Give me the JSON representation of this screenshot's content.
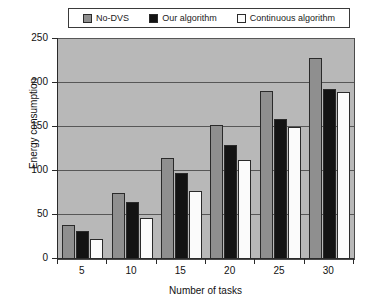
{
  "chart_data": {
    "type": "bar",
    "title": "",
    "xlabel": "Number of tasks",
    "ylabel": "Energy consumption",
    "categories": [
      "5",
      "10",
      "15",
      "20",
      "25",
      "30"
    ],
    "ylim": [
      0,
      250
    ],
    "yticks": [
      0,
      50,
      100,
      150,
      200,
      250
    ],
    "ytick_labels": [
      "0",
      "50",
      "100",
      "150",
      "200",
      "250"
    ],
    "grid": true,
    "legend_position": "top",
    "plot_background": "#b8b8b8",
    "series": [
      {
        "name": "No-DVS",
        "color": "#8f8f8f",
        "values": [
          39,
          75,
          115,
          152,
          191,
          228
        ]
      },
      {
        "name": "Our algorithm",
        "color": "#131313",
        "values": [
          32,
          65,
          98,
          129,
          159,
          193
        ]
      },
      {
        "name": "Continuous algorithm",
        "color": "#fbfbfb",
        "values": [
          23,
          47,
          77,
          112,
          150,
          190
        ]
      }
    ]
  },
  "legend": {
    "entries": [
      {
        "label": "No-DVS",
        "color": "#8f8f8f"
      },
      {
        "label": "Our algorithm",
        "color": "#131313"
      },
      {
        "label": "Continuous algorithm",
        "color": "#fbfbfb"
      }
    ]
  }
}
